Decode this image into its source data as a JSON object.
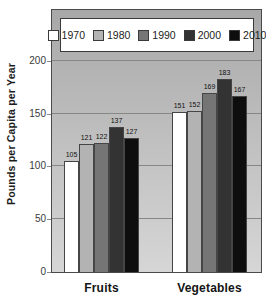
{
  "chart_data": {
    "type": "bar",
    "title": "",
    "ylabel": "Pounds per Capita per Year",
    "xlabel": "",
    "categories": [
      "Fruits",
      "Vegetables"
    ],
    "series": [
      {
        "name": "1970",
        "color": "#ffffff",
        "values": [
          105,
          151
        ]
      },
      {
        "name": "1980",
        "color": "#b3b3b3",
        "values": [
          121,
          152
        ]
      },
      {
        "name": "1990",
        "color": "#757575",
        "values": [
          122,
          169
        ]
      },
      {
        "name": "2000",
        "color": "#333333",
        "values": [
          137,
          183
        ]
      },
      {
        "name": "2010",
        "color": "#0e0e0e",
        "values": [
          127,
          167
        ]
      }
    ],
    "ylim": [
      0,
      248
    ],
    "yticks": [
      0,
      50,
      100,
      150,
      200
    ],
    "grid": true,
    "legend_position": "top",
    "bar_value_labels_shown": true,
    "plot_background": "gray-gradient",
    "axis_border_color": "#4a4a4a"
  }
}
